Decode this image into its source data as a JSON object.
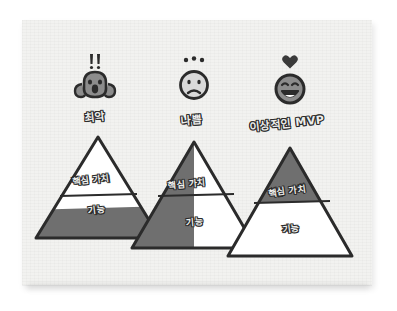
{
  "diagram": {
    "type": "pyramid-comparison",
    "background_color": "#ffffff",
    "paper_color": "#f2f2f0",
    "ink_color": "#2b2b2b",
    "fill_gray": "#6f6f6f",
    "fill_white": "#ffffff",
    "columns": [
      {
        "id": "worst",
        "mood_label": "최악",
        "face_icon": "screaming-face-icon",
        "face_accent_icon": "double-exclamation-icon",
        "face_color": "#8c8c8c",
        "tiers": [
          {
            "name": "핵심 가치",
            "fill": "white"
          },
          {
            "name": "기능",
            "fill": "partial-gray-bottom"
          }
        ]
      },
      {
        "id": "bad",
        "mood_label": "나쁨",
        "face_icon": "frowning-face-icon",
        "face_accent_icon": "three-dots-icon",
        "face_color": "#d9d9d9",
        "tiers": [
          {
            "name": "핵심 가치",
            "fill": "half-gray-left"
          },
          {
            "name": "기능",
            "fill": "half-gray-left"
          }
        ]
      },
      {
        "id": "ideal-mvp",
        "mood_label": "이상적인 MVP",
        "face_icon": "grinning-face-icon",
        "face_accent_icon": "heart-icon",
        "face_color": "#8c8c8c",
        "tiers": [
          {
            "name": "핵심 가치",
            "fill": "full-gray"
          },
          {
            "name": "기능",
            "fill": "white-with-gray-wedge"
          }
        ]
      }
    ]
  }
}
